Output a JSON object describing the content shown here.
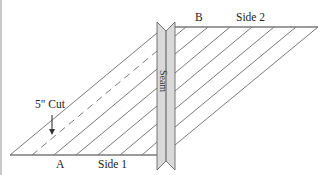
{
  "diagram": {
    "type": "quilting-bias-strip-diagram",
    "labels": {
      "point_a": "A",
      "point_b": "B",
      "side_1": "Side 1",
      "side_2": "Side 2",
      "seam": "Seam",
      "cut": "5\" Cut"
    },
    "colors": {
      "line": "#777777",
      "seam_fill": "#d9d9d9",
      "seam_stroke": "#666666",
      "text": "#222222",
      "background": "#ffffff"
    },
    "elements": {
      "bottom_edge": "Side 1 horizontal edge",
      "top_edge": "Side 2 horizontal edge",
      "diagonal_lines_left": 7,
      "diagonal_lines_right": 7,
      "dashed_cut_line": 1,
      "arrow": "down arrow pointing to dashed cut line"
    }
  }
}
